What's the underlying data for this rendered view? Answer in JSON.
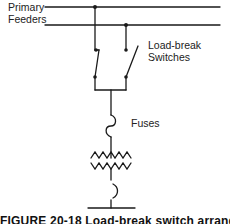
{
  "diagram": {
    "type": "single-line electrical schematic",
    "labels": {
      "feeders_line1": "Primary",
      "feeders_line2": "Feeders",
      "switches_line1": "Load-break",
      "switches_line2": "Switches",
      "fuses": "Fuses"
    },
    "caption": "FIGURE 20-18  Load-break switch arrangement",
    "components": [
      {
        "id": "feeder-1",
        "kind": "bus-line"
      },
      {
        "id": "feeder-2",
        "kind": "bus-line"
      },
      {
        "id": "switch-left",
        "kind": "load-break-switch",
        "state": "closed"
      },
      {
        "id": "switch-right",
        "kind": "load-break-switch",
        "state": "open"
      },
      {
        "id": "fuse",
        "kind": "fuse"
      },
      {
        "id": "transformer",
        "kind": "transformer"
      },
      {
        "id": "ground",
        "kind": "ground-connection"
      }
    ],
    "colors": {
      "line": "#1a1a1a",
      "background": "#ffffff"
    }
  }
}
